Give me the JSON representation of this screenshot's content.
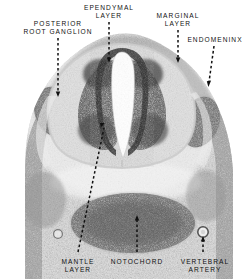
{
  "figure": {
    "background_color": "#ffffff",
    "ink_color": "#111111",
    "width": 249,
    "height": 279
  },
  "labels": [
    {
      "id": "posterior-root-ganglion",
      "text": "POSTERIOR\nROOT GANGLION",
      "x": 6,
      "y": 20,
      "width": 104,
      "align": "center"
    },
    {
      "id": "ependymal-layer",
      "text": "EPENDYMAL\nLAYER",
      "x": 78,
      "y": 4,
      "width": 62,
      "align": "center"
    },
    {
      "id": "marginal-layer",
      "text": "MARGINAL\nLAYER",
      "x": 150,
      "y": 12,
      "width": 56,
      "align": "center"
    },
    {
      "id": "endomeninx",
      "text": "ENDOMENINX",
      "x": 182,
      "y": 36,
      "width": 66,
      "align": "center"
    },
    {
      "id": "mantle-layer",
      "text": "MANTLE\nLAYER",
      "x": 47,
      "y": 258,
      "width": 62,
      "align": "center"
    },
    {
      "id": "notochord",
      "text": "NOTOCHORD",
      "x": 106,
      "y": 258,
      "width": 62,
      "align": "center"
    },
    {
      "id": "vertebral-artery",
      "text": "VERTEBRAL\nARTERY",
      "x": 172,
      "y": 258,
      "width": 66,
      "align": "center"
    }
  ],
  "leaders": [
    {
      "id": "leader-posterior-root-ganglion",
      "from": [
        58,
        38
      ],
      "to": [
        58,
        96
      ],
      "arrow": "down"
    },
    {
      "id": "leader-ependymal-layer",
      "from": [
        109,
        22
      ],
      "to": [
        109,
        62
      ],
      "arrow": "down"
    },
    {
      "id": "leader-marginal-layer",
      "from": [
        178,
        30
      ],
      "to": [
        178,
        62
      ],
      "arrow": "down"
    },
    {
      "id": "leader-endomeninx",
      "from": [
        214,
        46
      ],
      "to": [
        208,
        86
      ],
      "arrow": "down"
    },
    {
      "id": "leader-mantle-layer",
      "from": [
        78,
        254
      ],
      "to": [
        104,
        124
      ],
      "arrow": "up"
    },
    {
      "id": "leader-notochord",
      "from": [
        137,
        254
      ],
      "to": [
        137,
        216
      ],
      "arrow": "up"
    },
    {
      "id": "leader-vertebral-artery",
      "from": [
        203,
        254
      ],
      "to": [
        203,
        228
      ],
      "arrow": "up"
    }
  ],
  "anatomy": {
    "central_canal": "slit-shaped lumen at midline",
    "structures": [
      "posterior root ganglion",
      "ependymal layer",
      "marginal layer",
      "endomeninx",
      "mantle layer",
      "notochord",
      "vertebral artery"
    ]
  }
}
